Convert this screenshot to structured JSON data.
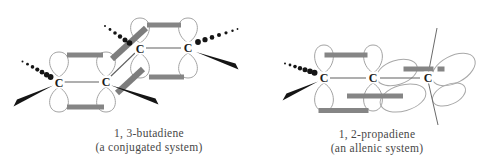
{
  "figure": {
    "left": {
      "name_line": "1, 3-butadiene",
      "system_line": "(a conjugated system)",
      "carbons": [
        {
          "label": "C"
        },
        {
          "label": "C"
        },
        {
          "label": "C"
        },
        {
          "label": "C"
        }
      ]
    },
    "right": {
      "name_line": "1, 2-propadiene",
      "system_line": "(an allenic system)",
      "carbons": [
        {
          "label": "C"
        },
        {
          "label": "C"
        },
        {
          "label": "C"
        }
      ]
    },
    "colors": {
      "background": "#ffffff",
      "orbital_outline": "#a3a3a3",
      "pi_overlap_bar": "#858585",
      "sigma_bond": "#606060",
      "wedge_bond": "#151515",
      "carbon_label": "#1c1c1c",
      "caption_text": "#474747"
    }
  }
}
